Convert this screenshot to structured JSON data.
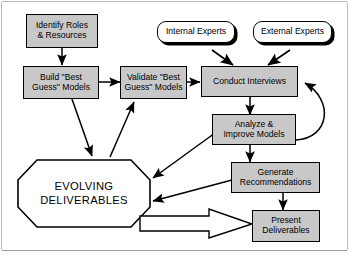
{
  "diagram": {
    "background_color": "#ffffff",
    "node_fill_color": "#c8c8c8",
    "terminator_fill_color": "#ffffff",
    "line_color": "#000000",
    "nodes": {
      "identify_roles": {
        "line1": "Identify Roles",
        "line2": "& Resources",
        "shape": "rectangle"
      },
      "build_models": {
        "line1": "Build \"Best",
        "line2": "Guess\" Models",
        "shape": "rectangle"
      },
      "validate_models": {
        "line1": "Validate \"Best",
        "line2": "Guess\" Models",
        "shape": "rectangle"
      },
      "internal_experts": {
        "line1": "Internal Experts",
        "shape": "rounded-shadow"
      },
      "external_experts": {
        "line1": "External Experts",
        "shape": "rounded-shadow"
      },
      "conduct_interviews": {
        "line1": "Conduct Interviews",
        "shape": "rectangle"
      },
      "analyze_models": {
        "line1": "Analyze &",
        "line2": "Improve Models",
        "shape": "rectangle"
      },
      "generate_recommendations": {
        "line1": "Generate",
        "line2": "Recommendations",
        "shape": "rectangle"
      },
      "present_deliverables": {
        "line1": "Present",
        "line2": "Deliverables",
        "shape": "rectangle"
      },
      "evolving_deliverables": {
        "line1": "EVOLVING",
        "line2": "DELIVERABLES",
        "shape": "octagon"
      }
    },
    "edges": [
      {
        "from": "identify_roles",
        "to": "build_models",
        "style": "solid-arrow"
      },
      {
        "from": "build_models",
        "to": "validate_models",
        "style": "solid-arrow"
      },
      {
        "from": "build_models",
        "to": "evolving_deliverables",
        "style": "solid-arrow"
      },
      {
        "from": "evolving_deliverables",
        "to": "validate_models",
        "style": "solid-arrow"
      },
      {
        "from": "validate_models",
        "to": "conduct_interviews",
        "style": "solid-arrow"
      },
      {
        "from": "internal_experts",
        "to": "conduct_interviews",
        "style": "solid-arrow"
      },
      {
        "from": "external_experts",
        "to": "conduct_interviews",
        "style": "solid-arrow"
      },
      {
        "from": "conduct_interviews",
        "to": "analyze_models",
        "style": "solid-arrow"
      },
      {
        "from": "analyze_models",
        "to": "conduct_interviews",
        "style": "curved-feedback-arrow"
      },
      {
        "from": "analyze_models",
        "to": "evolving_deliverables",
        "style": "double-arrow"
      },
      {
        "from": "analyze_models",
        "to": "generate_recommendations",
        "style": "solid-arrow"
      },
      {
        "from": "generate_recommendations",
        "to": "evolving_deliverables",
        "style": "double-arrow"
      },
      {
        "from": "generate_recommendations",
        "to": "present_deliverables",
        "style": "solid-arrow"
      },
      {
        "from": "evolving_deliverables",
        "to": "present_deliverables",
        "style": "hollow-block-arrow"
      }
    ]
  }
}
